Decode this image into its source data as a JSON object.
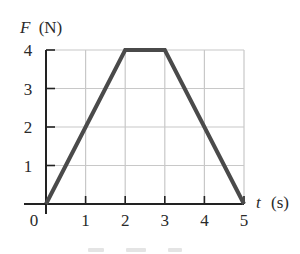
{
  "chart_data": {
    "type": "line",
    "title": "",
    "xlabel": "t (s)",
    "ylabel": "F (N)",
    "xlabel_var": "t",
    "xlabel_unit": "(s)",
    "ylabel_var": "F",
    "ylabel_unit": "(N)",
    "x_ticks": [
      "0",
      "1",
      "2",
      "3",
      "4",
      "5"
    ],
    "y_ticks": [
      "1",
      "2",
      "3",
      "4"
    ],
    "xlim": [
      0,
      5
    ],
    "ylim": [
      0,
      4
    ],
    "grid": true,
    "legend": null,
    "series": [
      {
        "name": "F(t)",
        "x": [
          0,
          2,
          3,
          5
        ],
        "y": [
          0,
          4,
          4,
          0
        ]
      }
    ]
  },
  "colors": {
    "line": "#4a4a4a",
    "grid": "#c8c8c8",
    "axis": "#222222",
    "text": "#2a2a2a",
    "background": "#ffffff"
  }
}
